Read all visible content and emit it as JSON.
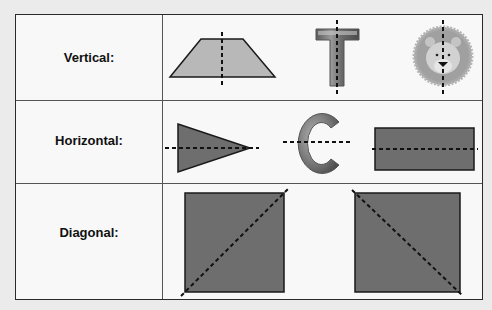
{
  "diagram": {
    "rows": [
      {
        "label": "Vertical:",
        "examples": [
          "trapezoid",
          "letter-T",
          "lion-face"
        ],
        "symmetry_axis": "vertical"
      },
      {
        "label": "Horizontal:",
        "examples": [
          "triangle",
          "letter-C",
          "rectangle"
        ],
        "symmetry_axis": "horizontal"
      },
      {
        "label": "Diagonal:",
        "examples": [
          "square",
          "square"
        ],
        "symmetry_axis": "diagonal"
      }
    ],
    "letters": {
      "t": "T",
      "c": "C"
    },
    "colors": {
      "light_fill": "#b8b8b8",
      "dark_fill": "#6e6e6e",
      "stroke": "#1a1a1a",
      "axis_dash": "#111111",
      "border": "#2a2a2a"
    }
  }
}
